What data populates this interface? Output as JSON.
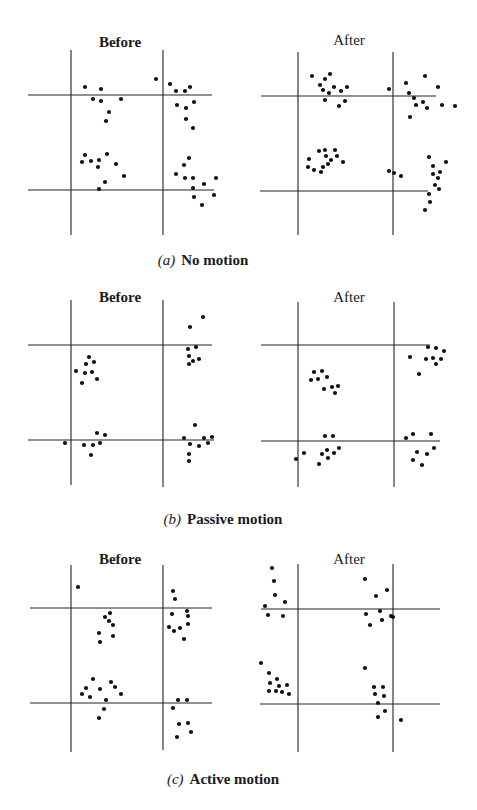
{
  "figure": {
    "panels": [
      {
        "id": "a",
        "caption_letter": "(a)",
        "caption_text": "No motion",
        "caption_pos": [
          203,
          270
        ],
        "before": {
          "title": "Before",
          "title_pos": [
            120,
            48
          ],
          "vlines": [
            [
              71,
              50,
              235
            ],
            [
              163,
              50,
              235
            ]
          ],
          "hlines": [
            [
              95,
              28,
              212
            ],
            [
              190,
              28,
              214
            ]
          ],
          "dots": [
            [
              85,
              87
            ],
            [
              101,
              89
            ],
            [
              93,
              99
            ],
            [
              101,
              101
            ],
            [
              121,
              99
            ],
            [
              109,
              112
            ],
            [
              106,
              121
            ],
            [
              156,
              79
            ],
            [
              170,
              84
            ],
            [
              176,
              91
            ],
            [
              185,
              91
            ],
            [
              190,
              87
            ],
            [
              194,
              102
            ],
            [
              177,
              105
            ],
            [
              186,
              108
            ],
            [
              186,
              119
            ],
            [
              193,
              128
            ],
            [
              85,
              155
            ],
            [
              82,
              162
            ],
            [
              91,
              161
            ],
            [
              99,
              160
            ],
            [
              107,
              154
            ],
            [
              98,
              167
            ],
            [
              116,
              164
            ],
            [
              124,
              176
            ],
            [
              105,
              182
            ],
            [
              99,
              189
            ],
            [
              189,
              158
            ],
            [
              184,
              165
            ],
            [
              176,
              174
            ],
            [
              185,
              178
            ],
            [
              193,
              178
            ],
            [
              193,
              188
            ],
            [
              216,
              178
            ],
            [
              204,
              184
            ],
            [
              194,
              197
            ],
            [
              214,
              195
            ],
            [
              202,
              205
            ]
          ]
        },
        "after": {
          "title": "After",
          "title_pos": [
            349,
            46
          ],
          "vlines": [
            [
              298,
              52,
              235
            ],
            [
              393,
              52,
              235
            ]
          ],
          "hlines": [
            [
              96,
              261,
              436
            ],
            [
              191,
              260,
              428
            ]
          ],
          "dots": [
            [
              312,
              76
            ],
            [
              330,
              74
            ],
            [
              325,
              79
            ],
            [
              320,
              85
            ],
            [
              323,
              90
            ],
            [
              329,
              93
            ],
            [
              334,
              87
            ],
            [
              341,
              91
            ],
            [
              347,
              87
            ],
            [
              325,
              100
            ],
            [
              339,
              106
            ],
            [
              345,
              101
            ],
            [
              389,
              89
            ],
            [
              406,
              83
            ],
            [
              425,
              76
            ],
            [
              438,
              87
            ],
            [
              409,
              93
            ],
            [
              414,
              98
            ],
            [
              416,
              105
            ],
            [
              423,
              102
            ],
            [
              427,
              108
            ],
            [
              442,
              105
            ],
            [
              455,
              106
            ],
            [
              410,
              117
            ],
            [
              319,
              151
            ],
            [
              325,
              150
            ],
            [
              335,
              150
            ],
            [
              326,
              156
            ],
            [
              337,
              156
            ],
            [
              331,
              160
            ],
            [
              343,
              162
            ],
            [
              309,
              159
            ],
            [
              308,
              167
            ],
            [
              314,
              170
            ],
            [
              321,
              172
            ],
            [
              323,
              167
            ],
            [
              328,
              164
            ],
            [
              389,
              171
            ],
            [
              394,
              173
            ],
            [
              401,
              176
            ],
            [
              429,
              157
            ],
            [
              446,
              162
            ],
            [
              433,
              166
            ],
            [
              440,
              172
            ],
            [
              433,
              174
            ],
            [
              438,
              178
            ],
            [
              435,
              185
            ],
            [
              439,
              189
            ],
            [
              429,
              194
            ],
            [
              430,
              202
            ],
            [
              425,
              210
            ]
          ]
        }
      },
      {
        "id": "b",
        "caption_letter": "(b)",
        "caption_text": "Passive motion",
        "caption_pos": [
          223,
          529
        ],
        "before": {
          "title": "Before",
          "title_pos": [
            120,
            302
          ],
          "vlines": [
            [
              71,
              300,
              485
            ],
            [
              163,
              300,
              487
            ]
          ],
          "hlines": [
            [
              345,
              28,
              212
            ],
            [
              440,
              28,
              214
            ]
          ],
          "dots": [
            [
              89,
              357
            ],
            [
              86,
              364
            ],
            [
              94,
              362
            ],
            [
              76,
              371
            ],
            [
              85,
              373
            ],
            [
              92,
              372
            ],
            [
              97,
              379
            ],
            [
              82,
              383
            ],
            [
              203,
              317
            ],
            [
              190,
              327
            ],
            [
              188,
              349
            ],
            [
              196,
              347
            ],
            [
              189,
              356
            ],
            [
              193,
              361
            ],
            [
              199,
              359
            ],
            [
              189,
              364
            ],
            [
              65,
              443
            ],
            [
              97,
              433
            ],
            [
              105,
              435
            ],
            [
              100,
              443
            ],
            [
              93,
              445
            ],
            [
              84,
              445
            ],
            [
              91,
              455
            ],
            [
              195,
              425
            ],
            [
              184,
              438
            ],
            [
              190,
              444
            ],
            [
              204,
              438
            ],
            [
              212,
              437
            ],
            [
              199,
              446
            ],
            [
              208,
              443
            ],
            [
              189,
              454
            ],
            [
              189,
              461
            ]
          ]
        },
        "after": {
          "title": "After",
          "title_pos": [
            349,
            302
          ],
          "vlines": [
            [
              298,
              302,
              487
            ],
            [
              394,
              302,
              487
            ]
          ],
          "hlines": [
            [
              345,
              261,
              430
            ],
            [
              441,
              261,
              440
            ]
          ],
          "dots": [
            [
              314,
              372
            ],
            [
              322,
              371
            ],
            [
              311,
              380
            ],
            [
              318,
              379
            ],
            [
              327,
              377
            ],
            [
              324,
              389
            ],
            [
              332,
              387
            ],
            [
              338,
              386
            ],
            [
              335,
              393
            ],
            [
              428,
              347
            ],
            [
              436,
              348
            ],
            [
              444,
              351
            ],
            [
              410,
              357
            ],
            [
              426,
              359
            ],
            [
              433,
              358
            ],
            [
              441,
              359
            ],
            [
              436,
              364
            ],
            [
              419,
              374
            ],
            [
              325,
              436
            ],
            [
              333,
              436
            ],
            [
              304,
              453
            ],
            [
              296,
              459
            ],
            [
              322,
              454
            ],
            [
              327,
              450
            ],
            [
              334,
              453
            ],
            [
              339,
              448
            ],
            [
              328,
              458
            ],
            [
              319,
              464
            ],
            [
              406,
              438
            ],
            [
              413,
              434
            ],
            [
              431,
              434
            ],
            [
              434,
              448
            ],
            [
              417,
              452
            ],
            [
              427,
              454
            ],
            [
              413,
              460
            ],
            [
              422,
              465
            ]
          ]
        }
      },
      {
        "id": "c",
        "caption_letter": "(c)",
        "caption_text": "Active motion",
        "caption_pos": [
          223,
          789
        ],
        "before": {
          "title": "Before",
          "title_pos": [
            120,
            564
          ],
          "vlines": [
            [
              71,
              565,
              752
            ],
            [
              163,
              565,
              750
            ]
          ],
          "hlines": [
            [
              608,
              30,
              212
            ],
            [
              703,
              30,
              212
            ]
          ],
          "dots": [
            [
              78,
              587
            ],
            [
              110,
              613
            ],
            [
              105,
              617
            ],
            [
              109,
              621
            ],
            [
              113,
              625
            ],
            [
              99,
              633
            ],
            [
              113,
              636
            ],
            [
              100,
              642
            ],
            [
              173,
              591
            ],
            [
              175,
              599
            ],
            [
              172,
              614
            ],
            [
              187,
              611
            ],
            [
              188,
              616
            ],
            [
              169,
              627
            ],
            [
              174,
              631
            ],
            [
              180,
              628
            ],
            [
              188,
              624
            ],
            [
              184,
              639
            ],
            [
              93,
              679
            ],
            [
              86,
              688
            ],
            [
              82,
              694
            ],
            [
              90,
              697
            ],
            [
              100,
              689
            ],
            [
              111,
              682
            ],
            [
              115,
              687
            ],
            [
              121,
              694
            ],
            [
              106,
              700
            ],
            [
              104,
              709
            ],
            [
              99,
              718
            ],
            [
              178,
              700
            ],
            [
              187,
              700
            ],
            [
              173,
              708
            ],
            [
              179,
              724
            ],
            [
              188,
              723
            ],
            [
              191,
              732
            ],
            [
              177,
              737
            ]
          ]
        },
        "after": {
          "title": "After",
          "title_pos": [
            349,
            564
          ],
          "vlines": [
            [
              298,
              564,
              752
            ],
            [
              393,
              564,
              752
            ]
          ],
          "hlines": [
            [
              609,
              261,
              440
            ],
            [
              704,
              260,
              440
            ]
          ],
          "dots": [
            [
              272,
              568
            ],
            [
              274,
              581
            ],
            [
              275,
              595
            ],
            [
              285,
              602
            ],
            [
              265,
              606
            ],
            [
              268,
              615
            ],
            [
              283,
              616
            ],
            [
              365,
              579
            ],
            [
              376,
              596
            ],
            [
              387,
              590
            ],
            [
              380,
              611
            ],
            [
              366,
              614
            ],
            [
              382,
              620
            ],
            [
              370,
              625
            ],
            [
              391,
              616
            ],
            [
              393,
              617
            ],
            [
              261,
              663
            ],
            [
              269,
              673
            ],
            [
              277,
              679
            ],
            [
              270,
              683
            ],
            [
              279,
              686
            ],
            [
              287,
              685
            ],
            [
              269,
              691
            ],
            [
              276,
              691
            ],
            [
              282,
              692
            ],
            [
              289,
              694
            ],
            [
              365,
              668
            ],
            [
              374,
              687
            ],
            [
              383,
              687
            ],
            [
              375,
              694
            ],
            [
              384,
              696
            ],
            [
              378,
              703
            ],
            [
              385,
              711
            ],
            [
              378,
              717
            ],
            [
              401,
              720
            ]
          ]
        }
      }
    ]
  },
  "labels": {
    "a_before_title": "Before",
    "a_after_title": "After",
    "a_caption_letter": "(a)",
    "a_caption_text": "No motion",
    "b_before_title": "Before",
    "b_after_title": "After",
    "b_caption_letter": "(b)",
    "b_caption_text": "Passive motion",
    "c_before_title": "Before",
    "c_after_title": "After",
    "c_caption_letter": "(c)",
    "c_caption_text": "Active motion"
  },
  "style": {
    "line_color": "#222222",
    "dot_color": "#111111",
    "dot_radius": 2.1,
    "line_width": 1.1
  }
}
